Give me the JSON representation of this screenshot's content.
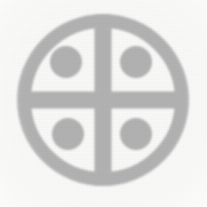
{
  "image": {
    "kind": "scanned-emblem",
    "width": 207,
    "height": 207,
    "background_color": "#f9f9f8",
    "alt_text": "Faded gray quartered circle emblem with four dots",
    "caption": ""
  },
  "emblem": {
    "name": "quartered-circle-with-four-dots",
    "stroke_color": "#b2b2b2",
    "fill_color": "#b2b2b2",
    "center": {
      "x": 103,
      "y": 100
    },
    "ring": {
      "name": "outer-ring",
      "outer_radius": 86,
      "inner_radius": 72,
      "thickness": 14
    },
    "cross": {
      "name": "inner-cross",
      "bar_thickness": 17,
      "horizontal_half_length": 80,
      "vertical_half_length": 86
    },
    "dots": [
      {
        "name": "dot-top-left",
        "cx": 66,
        "cy": 62,
        "r": 16
      },
      {
        "name": "dot-top-right",
        "cx": 136,
        "cy": 62,
        "r": 16
      },
      {
        "name": "dot-bottom-left",
        "cx": 68,
        "cy": 134,
        "r": 16
      },
      {
        "name": "dot-bottom-right",
        "cx": 136,
        "cy": 134,
        "r": 16
      }
    ]
  }
}
